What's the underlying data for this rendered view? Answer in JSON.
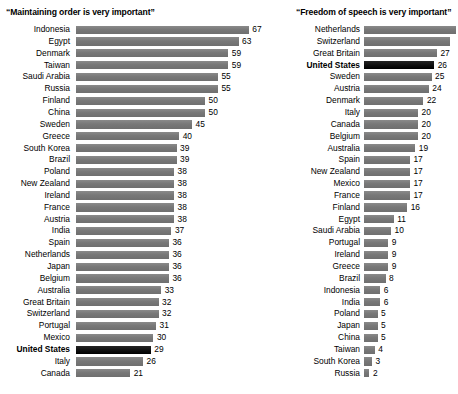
{
  "chart_data": {
    "type": "bar",
    "orientation": "horizontal",
    "grid": false,
    "legend": false,
    "xlabel": "",
    "ylabel": "",
    "value_suffix": "",
    "panels": [
      {
        "id": "maintaining-order",
        "title": "“Maintaining order is very important”",
        "xlim": [
          0,
          67
        ],
        "categories": [
          "Indonesia",
          "Egypt",
          "Denmark",
          "Taiwan",
          "Saudi Arabia",
          "Russia",
          "Finland",
          "China",
          "Sweden",
          "Greece",
          "South Korea",
          "Brazil",
          "Poland",
          "New Zealand",
          "Ireland",
          "France",
          "Austria",
          "India",
          "Spain",
          "Netherlands",
          "Japan",
          "Belgium",
          "Australia",
          "Great Britain",
          "Switzerland",
          "Portugal",
          "Mexico",
          "United States",
          "Italy",
          "Canada"
        ],
        "values": [
          67,
          63,
          59,
          59,
          55,
          55,
          50,
          50,
          45,
          40,
          39,
          39,
          38,
          38,
          38,
          38,
          38,
          37,
          36,
          36,
          36,
          36,
          33,
          32,
          32,
          31,
          30,
          29,
          26,
          21
        ],
        "highlight": "United States",
        "rows": [
          {
            "label": "Indonesia",
            "value": 67,
            "display": "67",
            "highlight": false,
            "clipped": false
          },
          {
            "label": "Egypt",
            "value": 63,
            "display": "63",
            "highlight": false,
            "clipped": false
          },
          {
            "label": "Denmark",
            "value": 59,
            "display": "59",
            "highlight": false,
            "clipped": false
          },
          {
            "label": "Taiwan",
            "value": 59,
            "display": "59",
            "highlight": false,
            "clipped": false
          },
          {
            "label": "Saudi Arabia",
            "value": 55,
            "display": "55",
            "highlight": false,
            "clipped": false
          },
          {
            "label": "Russia",
            "value": 55,
            "display": "55",
            "highlight": false,
            "clipped": false
          },
          {
            "label": "Finland",
            "value": 50,
            "display": "50",
            "highlight": false,
            "clipped": false
          },
          {
            "label": "China",
            "value": 50,
            "display": "50",
            "highlight": false,
            "clipped": false
          },
          {
            "label": "Sweden",
            "value": 45,
            "display": "45",
            "highlight": false,
            "clipped": false
          },
          {
            "label": "Greece",
            "value": 40,
            "display": "40",
            "highlight": false,
            "clipped": false
          },
          {
            "label": "South Korea",
            "value": 39,
            "display": "39",
            "highlight": false,
            "clipped": false
          },
          {
            "label": "Brazil",
            "value": 39,
            "display": "39",
            "highlight": false,
            "clipped": false
          },
          {
            "label": "Poland",
            "value": 38,
            "display": "38",
            "highlight": false,
            "clipped": false
          },
          {
            "label": "New Zealand",
            "value": 38,
            "display": "38",
            "highlight": false,
            "clipped": false
          },
          {
            "label": "Ireland",
            "value": 38,
            "display": "38",
            "highlight": false,
            "clipped": false
          },
          {
            "label": "France",
            "value": 38,
            "display": "38",
            "highlight": false,
            "clipped": false
          },
          {
            "label": "Austria",
            "value": 38,
            "display": "38",
            "highlight": false,
            "clipped": false
          },
          {
            "label": "India",
            "value": 37,
            "display": "37",
            "highlight": false,
            "clipped": false
          },
          {
            "label": "Spain",
            "value": 36,
            "display": "36",
            "highlight": false,
            "clipped": false
          },
          {
            "label": "Netherlands",
            "value": 36,
            "display": "36",
            "highlight": false,
            "clipped": false
          },
          {
            "label": "Japan",
            "value": 36,
            "display": "36",
            "highlight": false,
            "clipped": false
          },
          {
            "label": "Belgium",
            "value": 36,
            "display": "36",
            "highlight": false,
            "clipped": false
          },
          {
            "label": "Australia",
            "value": 33,
            "display": "33",
            "highlight": false,
            "clipped": false
          },
          {
            "label": "Great Britain",
            "value": 32,
            "display": "32",
            "highlight": false,
            "clipped": false
          },
          {
            "label": "Switzerland",
            "value": 32,
            "display": "32",
            "highlight": false,
            "clipped": false
          },
          {
            "label": "Portugal",
            "value": 31,
            "display": "31",
            "highlight": false,
            "clipped": false
          },
          {
            "label": "Mexico",
            "value": 30,
            "display": "30",
            "highlight": false,
            "clipped": false
          },
          {
            "label": "United States",
            "value": 29,
            "display": "29",
            "highlight": true,
            "clipped": false
          },
          {
            "label": "Italy",
            "value": 26,
            "display": "26",
            "highlight": false,
            "clipped": false
          },
          {
            "label": "Canada",
            "value": 21,
            "display": "21",
            "highlight": false,
            "clipped": false
          }
        ]
      },
      {
        "id": "freedom-of-speech",
        "title": "“Freedom of speech is very important”",
        "xlim": [
          0,
          34
        ],
        "categories": [
          "Netherlands",
          "Switzerland",
          "Great Britain",
          "United States",
          "Sweden",
          "Austria",
          "Denmark",
          "Italy",
          "Canada",
          "Belgium",
          "Australia",
          "Spain",
          "New Zealand",
          "Mexico",
          "France",
          "Finland",
          "Egypt",
          "Saudi Arabia",
          "Portugal",
          "Ireland",
          "Greece",
          "Brazil",
          "Indonesia",
          "India",
          "Poland",
          "Japan",
          "China",
          "Taiwan",
          "South Korea",
          "Russia"
        ],
        "values": [
          34,
          32,
          27,
          26,
          25,
          24,
          22,
          20,
          20,
          20,
          19,
          17,
          17,
          17,
          17,
          16,
          11,
          10,
          9,
          9,
          9,
          8,
          6,
          6,
          5,
          5,
          5,
          4,
          3,
          2
        ],
        "highlight": "United States",
        "rows": [
          {
            "label": "Netherlands",
            "value": 34,
            "display": "",
            "highlight": false,
            "clipped": true
          },
          {
            "label": "Switzerland",
            "value": 32,
            "display": "",
            "highlight": false,
            "clipped": true
          },
          {
            "label": "Great Britain",
            "value": 27,
            "display": "27",
            "highlight": false,
            "clipped": false
          },
          {
            "label": "United States",
            "value": 26,
            "display": "26",
            "highlight": true,
            "clipped": false
          },
          {
            "label": "Sweden",
            "value": 25,
            "display": "25",
            "highlight": false,
            "clipped": false
          },
          {
            "label": "Austria",
            "value": 24,
            "display": "24",
            "highlight": false,
            "clipped": false
          },
          {
            "label": "Denmark",
            "value": 22,
            "display": "22",
            "highlight": false,
            "clipped": false
          },
          {
            "label": "Italy",
            "value": 20,
            "display": "20",
            "highlight": false,
            "clipped": false
          },
          {
            "label": "Canada",
            "value": 20,
            "display": "20",
            "highlight": false,
            "clipped": false
          },
          {
            "label": "Belgium",
            "value": 20,
            "display": "20",
            "highlight": false,
            "clipped": false
          },
          {
            "label": "Australia",
            "value": 19,
            "display": "19",
            "highlight": false,
            "clipped": false
          },
          {
            "label": "Spain",
            "value": 17,
            "display": "17",
            "highlight": false,
            "clipped": false
          },
          {
            "label": "New Zealand",
            "value": 17,
            "display": "17",
            "highlight": false,
            "clipped": false
          },
          {
            "label": "Mexico",
            "value": 17,
            "display": "17",
            "highlight": false,
            "clipped": false
          },
          {
            "label": "France",
            "value": 17,
            "display": "17",
            "highlight": false,
            "clipped": false
          },
          {
            "label": "Finland",
            "value": 16,
            "display": "16",
            "highlight": false,
            "clipped": false
          },
          {
            "label": "Egypt",
            "value": 11,
            "display": "11",
            "highlight": false,
            "clipped": false
          },
          {
            "label": "Saudi Arabia",
            "value": 10,
            "display": "10",
            "highlight": false,
            "clipped": false
          },
          {
            "label": "Portugal",
            "value": 9,
            "display": "9",
            "highlight": false,
            "clipped": false
          },
          {
            "label": "Ireland",
            "value": 9,
            "display": "9",
            "highlight": false,
            "clipped": false
          },
          {
            "label": "Greece",
            "value": 9,
            "display": "9",
            "highlight": false,
            "clipped": false
          },
          {
            "label": "Brazil",
            "value": 8,
            "display": "8",
            "highlight": false,
            "clipped": false
          },
          {
            "label": "Indonesia",
            "value": 6,
            "display": "6",
            "highlight": false,
            "clipped": false
          },
          {
            "label": "India",
            "value": 6,
            "display": "6",
            "highlight": false,
            "clipped": false
          },
          {
            "label": "Poland",
            "value": 5,
            "display": "5",
            "highlight": false,
            "clipped": false
          },
          {
            "label": "Japan",
            "value": 5,
            "display": "5",
            "highlight": false,
            "clipped": false
          },
          {
            "label": "China",
            "value": 5,
            "display": "5",
            "highlight": false,
            "clipped": false
          },
          {
            "label": "Taiwan",
            "value": 4,
            "display": "4",
            "highlight": false,
            "clipped": false
          },
          {
            "label": "South Korea",
            "value": 3,
            "display": "3",
            "highlight": false,
            "clipped": false
          },
          {
            "label": "Russia",
            "value": 2,
            "display": "2",
            "highlight": false,
            "clipped": false
          }
        ]
      }
    ],
    "colors": {
      "bar": "#7d7d7d",
      "bar_highlight": "#141414",
      "text": "#000000",
      "background": "#ffffff"
    }
  }
}
